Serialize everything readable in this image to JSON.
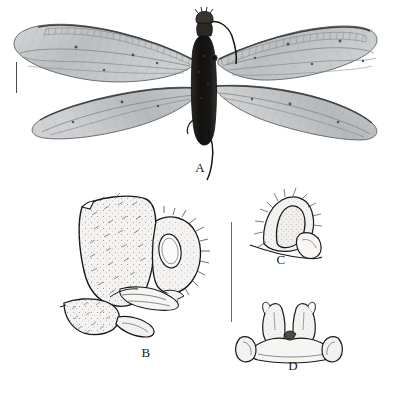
{
  "figure": {
    "background_color": "#ffffff",
    "ink_color": "#1a1a1a",
    "panel_count": 4
  },
  "panels": [
    {
      "id": "A",
      "label": "A",
      "label_x": 200,
      "label_y": 166,
      "caption_role": "habitus-photograph",
      "subject": "winged insect habitus, dorsal view",
      "rendering": "halftone photograph",
      "body_color": "#1c1a18",
      "wing_color": "#b9bcbe",
      "wing_count": 4,
      "has_antennae": true,
      "has_cerci": true
    },
    {
      "id": "B",
      "label": "B",
      "label_x": 143,
      "label_y": 351,
      "caption_role": "line-drawing",
      "subject": "terminalia, lateral view",
      "rendering": "stippled line drawing with setae",
      "fill_color": "#f2f1ef",
      "line_color": "#1a1a1a"
    },
    {
      "id": "C",
      "label": "C",
      "label_x": 278,
      "label_y": 258,
      "caption_role": "line-drawing",
      "subject": "gonocoxite detail, lateral view",
      "rendering": "stippled line drawing with setae",
      "fill_color": "#f2f1ef",
      "line_color": "#1a1a1a"
    },
    {
      "id": "D",
      "label": "D",
      "label_x": 290,
      "label_y": 364,
      "caption_role": "line-drawing",
      "subject": "gonocoxites, ventral view",
      "rendering": "stippled line drawing",
      "fill_color": "#f2f1ef",
      "line_color": "#1a1a1a"
    }
  ],
  "scale_bars": [
    {
      "id": "scale-bar-a",
      "for_panel": "A",
      "orientation": "vertical",
      "x": 16,
      "y": 62,
      "length": 31,
      "thickness": 1,
      "color": "#4a4a4a",
      "label": ""
    },
    {
      "id": "scale-bar-bcd",
      "for_panel": "B, C, D",
      "orientation": "vertical",
      "x": 231,
      "y": 222,
      "length": 100,
      "thickness": 1,
      "color": "#6a6a6a",
      "label": ""
    }
  ]
}
